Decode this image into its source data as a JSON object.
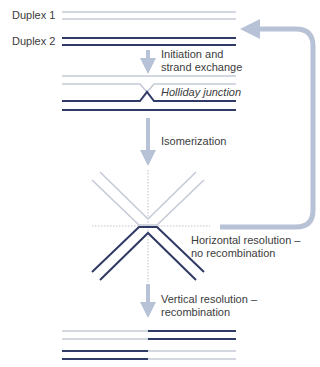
{
  "colors": {
    "light_strand": "#c4cad6",
    "dark_strand": "#2f3a66",
    "arrow": "#b8c2d6",
    "dashed": "#b0b4bc",
    "text": "#3c3c3c"
  },
  "labels": {
    "duplex1": "Duplex 1",
    "duplex2": "Duplex 2",
    "step1_line1": "Initiation and",
    "step1_line2": "strand exchange",
    "holliday": "Holliday junction",
    "step2": "Isomerization",
    "horizontal_line1": "Horizontal resolution –",
    "horizontal_line2": "no recombination",
    "vertical_line1": "Vertical resolution –",
    "vertical_line2": "recombination"
  },
  "stages": [
    {
      "name": "initial duplexes",
      "strands": [
        "light",
        "light",
        "dark",
        "dark"
      ]
    },
    {
      "name": "holliday junction",
      "strands": [
        "light",
        "light-crossing",
        "dark-crossing",
        "dark"
      ]
    },
    {
      "name": "isomerized junction",
      "arms": [
        "light upper-left",
        "light upper-right",
        "dark lower-left",
        "dark lower-right"
      ]
    },
    {
      "name": "recombinant products",
      "strands": [
        "light|dark",
        "light|dark",
        "dark|light",
        "dark|light"
      ]
    }
  ]
}
